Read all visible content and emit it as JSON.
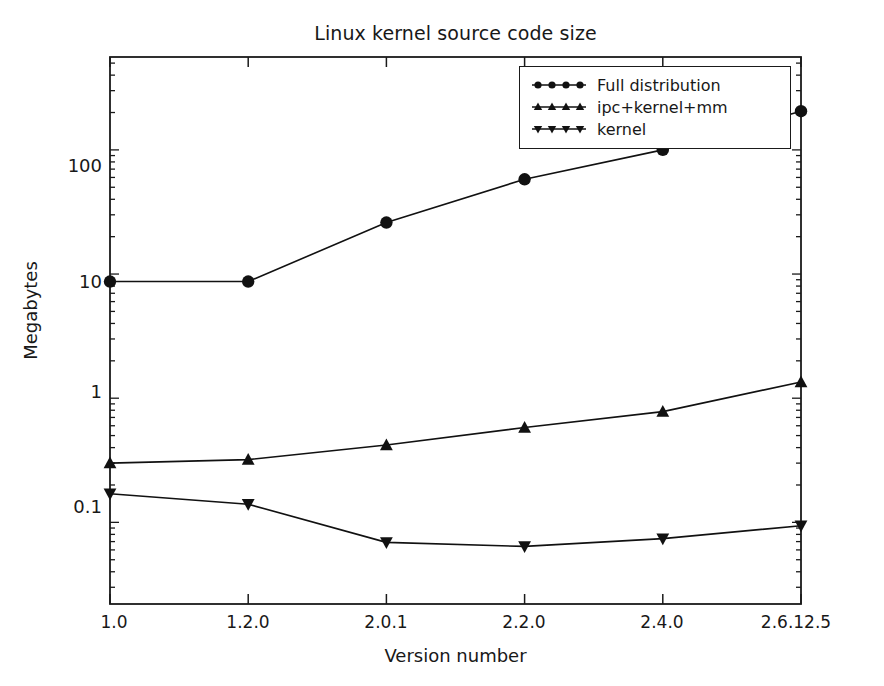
{
  "chart_data": {
    "type": "line",
    "title": "Linux kernel source code size",
    "xlabel": "Version number",
    "ylabel": "Megabytes",
    "yscale": "log",
    "ylim": [
      0.022,
      560
    ],
    "grid": false,
    "legend_position": "top-right",
    "categories": [
      "1.0",
      "1.2.0",
      "2.0.1",
      "2.2.0",
      "2.4.0",
      "2.6.12.5"
    ],
    "ytick_labels": [
      "0.1",
      "1",
      "10",
      "100"
    ],
    "ytick_values": [
      0.1,
      1,
      10,
      100
    ],
    "series": [
      {
        "name": "Full distribution",
        "marker": "circle",
        "values": [
          8.7,
          8.7,
          26.0,
          58.0,
          100.0,
          205.0
        ]
      },
      {
        "name": "ipc+kernel+mm",
        "marker": "triangle-up",
        "values": [
          0.3,
          0.32,
          0.42,
          0.58,
          0.78,
          1.35
        ]
      },
      {
        "name": "kernel",
        "marker": "triangle-down",
        "values": [
          0.17,
          0.14,
          0.069,
          0.064,
          0.074,
          0.094
        ]
      }
    ]
  },
  "colors": {
    "foreground": "#1a1a1a",
    "background": "#ffffff",
    "series": [
      "#111111",
      "#111111",
      "#111111"
    ]
  },
  "icons": {
    "circle": "circle-marker-icon",
    "triangle_up": "triangle-up-marker-icon",
    "triangle_down": "triangle-down-marker-icon"
  }
}
